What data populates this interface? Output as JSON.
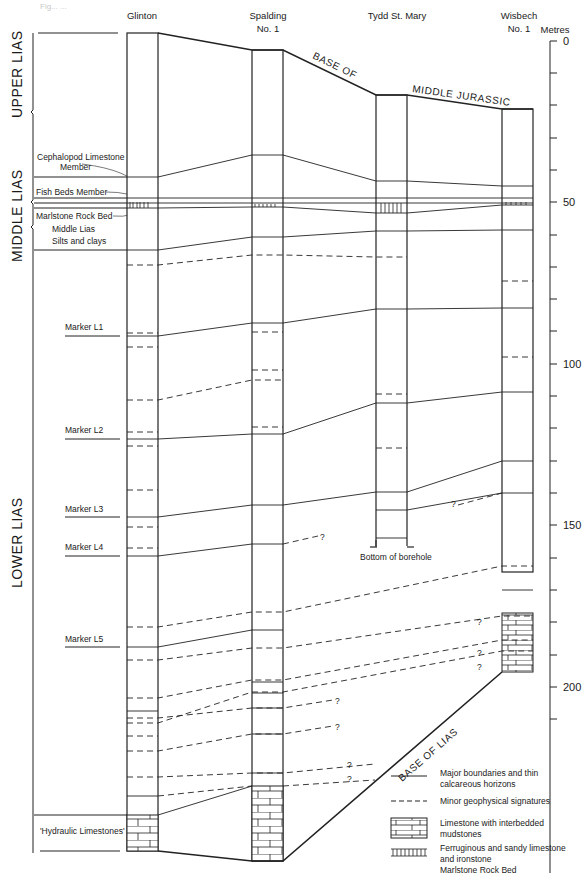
{
  "title_faint": "Fig... ...",
  "boreholes": [
    {
      "name_line1": "Glinton",
      "name_line2": ""
    },
    {
      "name_line1": "Spalding",
      "name_line2": "No. 1"
    },
    {
      "name_line1": "Tydd St. Mary",
      "name_line2": ""
    },
    {
      "name_line1": "Wisbech",
      "name_line2": "No. 1"
    }
  ],
  "scale": {
    "unit": "Metres",
    "ticks": [
      "0",
      "50",
      "100",
      "150",
      "200"
    ]
  },
  "stages": {
    "upper": "UPPER LIAS",
    "middle": "MIDDLE LIAS",
    "lower": "LOWER LIAS"
  },
  "units": {
    "cephalopod_line1": "Cephalopod Limestone",
    "cephalopod_line2": "Member",
    "fish_beds": "Fish Beds Member",
    "marlstone": "Marlstone Rock Bed",
    "middle_lias_line1": "Middle Lias",
    "middle_lias_line2": "Silts and clays",
    "hydraulic": "'Hydraulic Limestones'"
  },
  "markers": [
    "Marker L1",
    "Marker L2",
    "Marker L3",
    "Marker L4",
    "Marker L5"
  ],
  "annotations": {
    "base_of": "BASE OF",
    "middle_jurassic": "MIDDLE JURASSIC",
    "base_of_lias": "BASE OF LIAS",
    "bottom_of_borehole": "Bottom of borehole",
    "query": "?"
  },
  "legend": [
    {
      "symbol": "solid-line",
      "line1": "Major boundaries and thin",
      "line2": "calcareous horizons",
      "line3": ""
    },
    {
      "symbol": "dashed-line",
      "line1": "Minor geophysical signatures",
      "line2": "",
      "line3": ""
    },
    {
      "symbol": "limestone-brick",
      "line1": "Limestone with interbedded",
      "line2": "mudstones",
      "line3": ""
    },
    {
      "symbol": "ironstone-bars",
      "line1": "Ferruginous and sandy limestone",
      "line2": "and ironstone",
      "line3": "Marlstone Rock Bed"
    }
  ]
}
